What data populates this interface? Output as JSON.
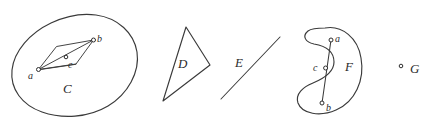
{
  "figure": {
    "background_color": "#ffffff",
    "stroke_color": "#3a3a3a",
    "point_fill_color": "#ffffff",
    "width": 434,
    "height": 124,
    "regions": [
      {
        "id": "C",
        "label": "C",
        "label_x": 63,
        "label_y": 82,
        "kind": "convex-blob",
        "description": "closed oval region containing points a, b, c and an inscribed quadrilateral"
      },
      {
        "id": "D",
        "label": "D",
        "label_x": 178,
        "label_y": 57,
        "kind": "triangle",
        "description": "triangular region"
      },
      {
        "id": "E",
        "label": "E",
        "label_x": 235,
        "label_y": 56,
        "kind": "segment",
        "description": "straight line segment"
      },
      {
        "id": "F",
        "label": "F",
        "label_x": 345,
        "label_y": 60,
        "kind": "crescent",
        "description": "non-convex kidney shaped region with points a, b inside and c outside on segment ab"
      },
      {
        "id": "G",
        "label": "G",
        "label_x": 410,
        "label_y": 62,
        "kind": "point",
        "description": "single isolated point"
      }
    ],
    "points": [
      {
        "id": "C-a",
        "label": "a",
        "cx": 38.5,
        "cy": 69.5,
        "r": 2.0,
        "label_x": 28,
        "label_y": 71
      },
      {
        "id": "C-b",
        "label": "b",
        "cx": 93.5,
        "cy": 40.0,
        "r": 2.0,
        "label_x": 97,
        "label_y": 34
      },
      {
        "id": "C-c",
        "label": "c",
        "cx": 66.0,
        "cy": 57.0,
        "r": 1.8,
        "label_x": 68,
        "label_y": 60
      },
      {
        "id": "F-a",
        "label": "a",
        "cx": 331.0,
        "cy": 40.0,
        "r": 2.0,
        "label_x": 335,
        "label_y": 34
      },
      {
        "id": "F-c",
        "label": "c",
        "cx": 325.0,
        "cy": 68.0,
        "r": 2.0,
        "label_x": 313,
        "label_y": 63
      },
      {
        "id": "F-b",
        "label": "b",
        "cx": 322.0,
        "cy": 103.0,
        "r": 2.0,
        "label_x": 326,
        "label_y": 103
      },
      {
        "id": "G-pt",
        "label": "",
        "cx": 401.0,
        "cy": 66.0,
        "r": 1.8,
        "label_x": 0,
        "label_y": 0
      }
    ]
  }
}
